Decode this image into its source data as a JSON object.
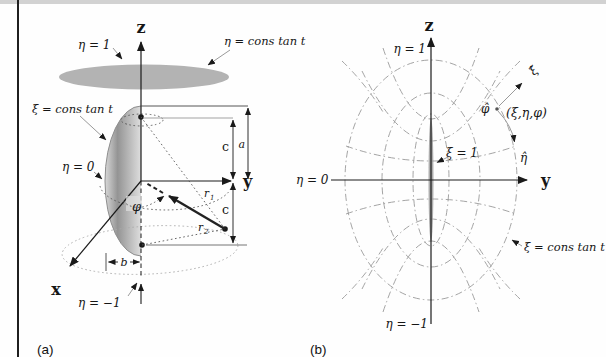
{
  "colors": {
    "ink": "#1a1a1a",
    "guide_gray": "#9a9a9a",
    "surface_gray": "#b3b3b3"
  },
  "figure_a": {
    "caption": "(a)",
    "axis": {
      "z": "z",
      "y": "y",
      "x": "x"
    },
    "labels": {
      "eta_1": "η = 1",
      "eta_const": "η = cons tan t",
      "xi_const": "ξ = cons tan t",
      "eta_0": "η = 0",
      "eta_neg1": "η = −1",
      "phi": "φ",
      "r1": {
        "base": "r",
        "sub": "1"
      },
      "r2": {
        "base": "r",
        "sub": "2"
      },
      "dim_a": "a",
      "dim_b": "b",
      "dim_c_upper": "c",
      "dim_c_lower": "c"
    }
  },
  "figure_b": {
    "caption": "(b)",
    "axis": {
      "z": "z",
      "y": "y"
    },
    "labels": {
      "eta_1": "η = 1",
      "eta_0": "η = 0",
      "eta_neg1": "η = −1",
      "xi_1": "ξ = 1",
      "xi_const": "ξ = cons tan t",
      "xi_hat": "ξ̂",
      "eta_hat": "η̂",
      "phi_hat": "φ̂",
      "point": "(ξ,η,φ)"
    }
  }
}
